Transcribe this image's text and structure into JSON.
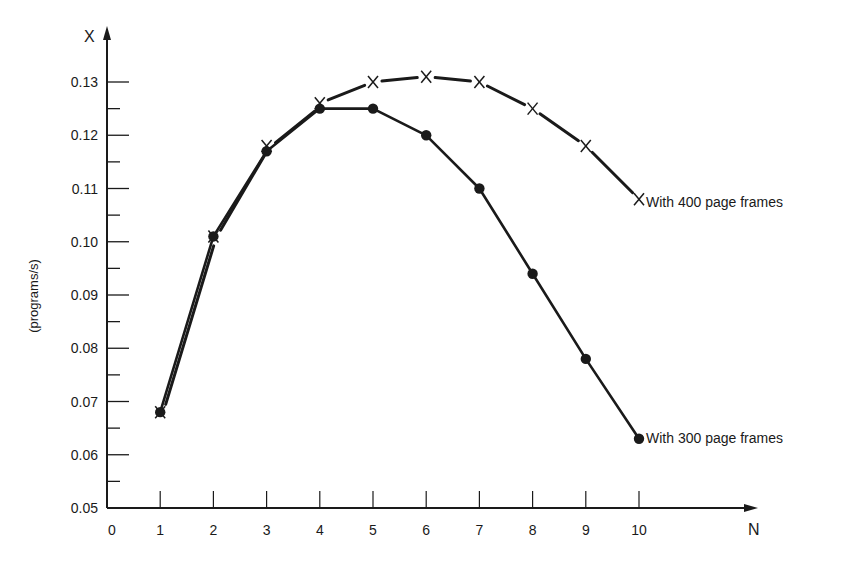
{
  "chart_data": {
    "type": "line",
    "title": "",
    "xlabel": "N",
    "ylabel": "X",
    "ylabel_unit": "(programs/s)",
    "x": [
      1,
      2,
      3,
      4,
      5,
      6,
      7,
      8,
      9,
      10
    ],
    "x_ticks": [
      "0",
      "1",
      "2",
      "3",
      "4",
      "5",
      "6",
      "7",
      "8",
      "9",
      "10"
    ],
    "y_ticks": [
      "0.05",
      "0.06",
      "0.07",
      "0.08",
      "0.09",
      "0.10",
      "0.11",
      "0.12",
      "0.13"
    ],
    "xlim": [
      0,
      10
    ],
    "ylim": [
      0.05,
      0.13
    ],
    "grid": false,
    "legend_position": "inline at series end",
    "series": [
      {
        "name": "With 400 page frames",
        "marker": "x",
        "line_style": "dashed",
        "values": [
          0.068,
          0.101,
          0.118,
          0.126,
          0.13,
          0.131,
          0.13,
          0.125,
          0.118,
          0.108
        ]
      },
      {
        "name": "With 300 page frames",
        "marker": "filled-circle",
        "line_style": "solid",
        "values": [
          0.068,
          0.101,
          0.117,
          0.125,
          0.125,
          0.12,
          0.11,
          0.094,
          0.078,
          0.063
        ]
      }
    ]
  },
  "labels": {
    "y_axis_letter": "X",
    "x_axis_letter": "N",
    "y_unit": "(programs/s)",
    "series_400": "With 400 page frames",
    "series_300": "With 300 page frames"
  }
}
